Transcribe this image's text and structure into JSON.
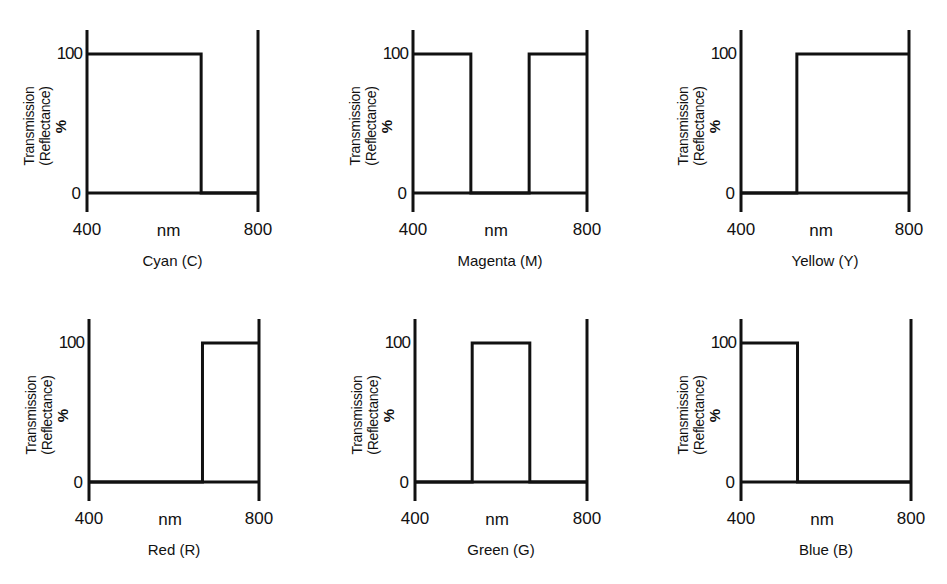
{
  "figure": {
    "y_axis_label_line1": "Transmission",
    "y_axis_label_line2": "(Reflectance)",
    "y_unit": "%",
    "x_unit": "nm",
    "y_ticks": [
      "100",
      "0"
    ],
    "x_ticks": [
      "400",
      "800"
    ],
    "line_color": "#111111",
    "background": "#ffffff"
  },
  "panels": [
    {
      "caption": "Cyan (C)"
    },
    {
      "caption": "Magenta (M)"
    },
    {
      "caption": "Yellow (Y)"
    },
    {
      "caption": "Red (R)"
    },
    {
      "caption": "Green (G)"
    },
    {
      "caption": "Blue (B)"
    }
  ],
  "chart_data": [
    {
      "type": "line",
      "title": "Cyan (C)",
      "xlabel": "nm",
      "ylabel": "Transmission (Reflectance) %",
      "x": [
        400,
        533,
        533,
        667,
        667,
        800
      ],
      "y": [
        100,
        100,
        100,
        100,
        0,
        0
      ],
      "steps": [
        [
          400,
          667,
          100
        ],
        [
          667,
          800,
          0
        ]
      ],
      "xlim": [
        400,
        800
      ],
      "ylim": [
        0,
        100
      ],
      "grid": false
    },
    {
      "type": "line",
      "title": "Magenta (M)",
      "xlabel": "nm",
      "ylabel": "Transmission (Reflectance) %",
      "steps": [
        [
          400,
          533,
          100
        ],
        [
          533,
          667,
          0
        ],
        [
          667,
          800,
          100
        ]
      ],
      "xlim": [
        400,
        800
      ],
      "ylim": [
        0,
        100
      ],
      "grid": false
    },
    {
      "type": "line",
      "title": "Yellow (Y)",
      "xlabel": "nm",
      "ylabel": "Transmission (Reflectance) %",
      "steps": [
        [
          400,
          533,
          0
        ],
        [
          533,
          800,
          100
        ]
      ],
      "xlim": [
        400,
        800
      ],
      "ylim": [
        0,
        100
      ],
      "grid": false
    },
    {
      "type": "line",
      "title": "Red (R)",
      "xlabel": "nm",
      "ylabel": "Transmission (Reflectance) %",
      "steps": [
        [
          400,
          667,
          0
        ],
        [
          667,
          800,
          100
        ]
      ],
      "xlim": [
        400,
        800
      ],
      "ylim": [
        0,
        100
      ],
      "grid": false
    },
    {
      "type": "line",
      "title": "Green (G)",
      "xlabel": "nm",
      "ylabel": "Transmission (Reflectance) %",
      "steps": [
        [
          400,
          533,
          0
        ],
        [
          533,
          667,
          100
        ],
        [
          667,
          800,
          0
        ]
      ],
      "xlim": [
        400,
        800
      ],
      "ylim": [
        0,
        100
      ],
      "grid": false
    },
    {
      "type": "line",
      "title": "Blue (B)",
      "xlabel": "nm",
      "ylabel": "Transmission (Reflectance) %",
      "steps": [
        [
          400,
          533,
          100
        ],
        [
          533,
          800,
          0
        ]
      ],
      "xlim": [
        400,
        800
      ],
      "ylim": [
        0,
        100
      ],
      "grid": false
    }
  ]
}
